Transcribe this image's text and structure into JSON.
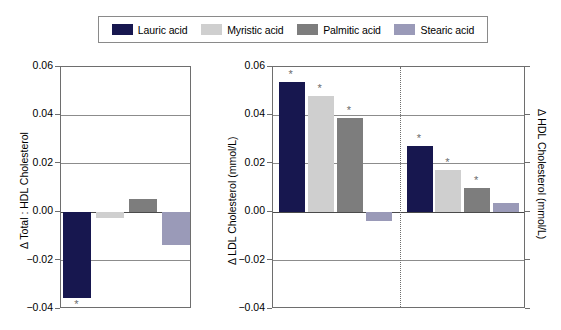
{
  "legend": {
    "entries": [
      {
        "label": "Lauric acid",
        "color": "#17174f"
      },
      {
        "label": "Myristic acid",
        "color": "#cfcfcf"
      },
      {
        "label": "Palmitic acid",
        "color": "#7d7d7d"
      },
      {
        "label": "Stearic acid",
        "color": "#9a9ab8"
      }
    ]
  },
  "chart_data": [
    {
      "type": "bar",
      "panel": "left",
      "title": "",
      "xlabel": "",
      "ylabel": "Δ Total : HDL Cholesterol",
      "ylim": [
        -0.04,
        0.06
      ],
      "yticks": [
        0.06,
        0.04,
        0.02,
        0.0,
        -0.02,
        -0.04
      ],
      "ytick_labels": [
        "0.06",
        "0.04",
        "0.02",
        "0.00",
        "−0.02",
        "−0.04"
      ],
      "grid": true,
      "categories": [
        "Lauric acid",
        "Myristic acid",
        "Palmitic acid",
        "Stearic acid"
      ],
      "values": [
        -0.0355,
        -0.0022,
        0.0055,
        -0.0135
      ],
      "significance": [
        "*",
        "",
        "",
        ""
      ],
      "colors": [
        "#17174f",
        "#cfcfcf",
        "#7d7d7d",
        "#9a9ab8"
      ]
    },
    {
      "type": "bar",
      "panel": "right",
      "title": "",
      "xlabel": "",
      "ylabel": "Δ LDL Cholesterol (mmol/L)",
      "ylabel_right": "Δ HDL Cholesterol (mmol/L)",
      "ylim": [
        -0.04,
        0.06
      ],
      "yticks": [
        0.06,
        0.04,
        0.02,
        0.0,
        -0.02,
        -0.04
      ],
      "ytick_labels": [
        "0.06",
        "0.04",
        "0.02",
        "0.00",
        "−0.02",
        "−0.04"
      ],
      "grid": true,
      "divider": true,
      "groups": [
        {
          "name": "LDL Cholesterol",
          "categories": [
            "Lauric acid",
            "Myristic acid",
            "Palmitic acid",
            "Stearic acid"
          ],
          "values": [
            0.0537,
            0.0482,
            0.039,
            -0.0036
          ],
          "significance": [
            "*",
            "*",
            "*",
            ""
          ],
          "colors": [
            "#17174f",
            "#cfcfcf",
            "#7d7d7d",
            "#9a9ab8"
          ]
        },
        {
          "name": "HDL Cholesterol",
          "categories": [
            "Lauric acid",
            "Myristic acid",
            "Palmitic acid",
            "Stearic acid"
          ],
          "values": [
            0.0272,
            0.0175,
            0.0102,
            0.0036
          ],
          "significance": [
            "*",
            "*",
            "*",
            ""
          ],
          "colors": [
            "#17174f",
            "#cfcfcf",
            "#7d7d7d",
            "#9a9ab8"
          ]
        }
      ]
    }
  ]
}
